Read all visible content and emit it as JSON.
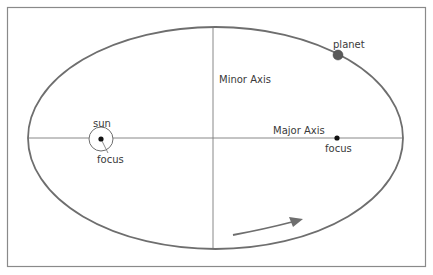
{
  "diagram": {
    "labels": {
      "sun": "sun",
      "sun_focus": "focus",
      "other_focus": "focus",
      "planet": "planet",
      "minor_axis": "Minor Axis",
      "major_axis": "Major Axis"
    },
    "geometry": {
      "frame": {
        "x": 7,
        "y": 7,
        "width": 418,
        "height": 260
      },
      "ellipse": {
        "cx": 215.5,
        "cy": 138,
        "rx": 187.5,
        "ry": 111
      },
      "sun_focus": {
        "x": 101,
        "y": 139
      },
      "empty_focus": {
        "x": 337,
        "y": 138
      },
      "planet": {
        "x": 338,
        "y": 55
      }
    },
    "colors": {
      "frame": "#8a8a8a",
      "orbit": "#6e6e6e",
      "axis": "#7a7a7a",
      "planet": "#5a5a5a",
      "focus": "#111111",
      "text": "#3a3a3a"
    }
  }
}
